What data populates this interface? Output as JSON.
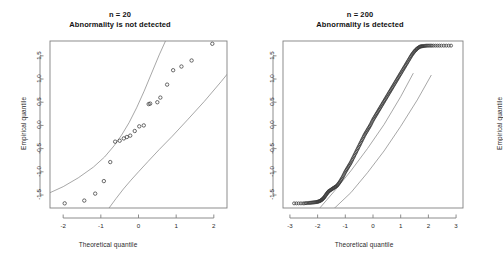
{
  "figure": {
    "background_color": "#ffffff",
    "axis_color": "#808080",
    "band_color": "#8a8a8a",
    "point_color": "#3a3a3a",
    "width": 480,
    "height": 256
  },
  "chart_data": [
    {
      "type": "scatter",
      "panel": "left",
      "title": "n = 20",
      "subtitle": "Abnormality is not detected",
      "xlabel": "Theoretical quantile",
      "ylabel": "Empirical quantile",
      "xlim": [
        -2.35,
        2.35
      ],
      "ylim": [
        -1.78,
        1.82
      ],
      "xticks": [
        -2,
        -1,
        0,
        1,
        2
      ],
      "xtick_labels": [
        "-2",
        "-1",
        "0",
        "1",
        "2"
      ],
      "yticks": [
        -1.5,
        -1.0,
        -0.5,
        0.0,
        0.5,
        1.0,
        1.5
      ],
      "ytick_labels": [
        "-1.5",
        "-1.0",
        "-0.5",
        "0.0",
        "0.5",
        "1.0",
        "1.5"
      ],
      "grid": false,
      "legend": "none",
      "points_label": "sample quantiles (n = 20)",
      "n": 20,
      "x": [
        -1.96,
        -1.44,
        -1.15,
        -0.92,
        -0.75,
        -0.62,
        -0.5,
        -0.39,
        -0.31,
        -0.22,
        -0.1,
        0.02,
        0.14,
        0.27,
        0.31,
        0.5,
        0.58,
        0.76,
        0.92,
        1.14,
        1.41,
        1.96
      ],
      "y": [
        -1.68,
        -1.62,
        -1.47,
        -1.2,
        -0.79,
        -0.35,
        -0.33,
        -0.28,
        -0.25,
        -0.22,
        -0.12,
        -0.02,
        0.0,
        0.46,
        0.47,
        0.5,
        0.6,
        0.88,
        1.19,
        1.27,
        1.4,
        1.76
      ],
      "band_upper_label": "upper confidence band",
      "band_lower_label": "lower confidence band",
      "band_upper_x": [
        -2.35,
        -2.0,
        -1.6,
        -1.2,
        -0.9,
        -0.65,
        -0.45,
        -0.25,
        -0.05,
        0.15,
        0.35,
        0.55,
        0.75
      ],
      "band_upper_y": [
        -1.45,
        -1.32,
        -1.13,
        -0.9,
        -0.68,
        -0.44,
        -0.21,
        0.06,
        0.38,
        0.74,
        1.13,
        1.52,
        1.88
      ],
      "band_lower_x": [
        -0.8,
        -0.6,
        -0.4,
        -0.2,
        0.0,
        0.25,
        0.55,
        0.9,
        1.3,
        1.75,
        2.2,
        2.35
      ],
      "band_lower_y": [
        -1.8,
        -1.58,
        -1.37,
        -1.18,
        -1.0,
        -0.78,
        -0.52,
        -0.23,
        0.12,
        0.52,
        0.95,
        1.1
      ]
    },
    {
      "type": "scatter",
      "panel": "right",
      "title": "n = 200",
      "subtitle": "Abnormality is detected",
      "xlabel": "Theoretical quantile",
      "ylabel": "Empirical quantile",
      "xlim": [
        -3.25,
        3.25
      ],
      "ylim": [
        -1.78,
        1.82
      ],
      "xticks": [
        -3,
        -2,
        -1,
        0,
        1,
        2,
        3
      ],
      "xtick_labels": [
        "-3",
        "-2",
        "-1",
        "0",
        "1",
        "2",
        "3"
      ],
      "yticks": [
        -1.5,
        -1.0,
        -0.5,
        0.0,
        0.5,
        1.0,
        1.5
      ],
      "ytick_labels": [
        "-1.5",
        "-1.0",
        "-0.5",
        "0.0",
        "0.5",
        "1.0",
        "1.5"
      ],
      "grid": false,
      "legend": "none",
      "points_label": "sample quantiles (n = 200)",
      "n": 200,
      "curve_x": [
        -2.85,
        -2.5,
        -2.3,
        -2.15,
        -2.02,
        -1.92,
        -1.84,
        -1.76,
        -1.68,
        -1.6,
        -1.5,
        -1.4,
        -1.3,
        -1.2,
        -1.1,
        -1.0,
        -0.9,
        -0.8,
        -0.7,
        -0.6,
        -0.5,
        -0.4,
        -0.3,
        -0.2,
        -0.1,
        0.0,
        0.1,
        0.2,
        0.3,
        0.4,
        0.5,
        0.6,
        0.7,
        0.8,
        0.9,
        1.0,
        1.1,
        1.2,
        1.3,
        1.4,
        1.5,
        1.6,
        1.7,
        1.8,
        1.95,
        2.15,
        2.45,
        2.82
      ],
      "curve_y": [
        -1.68,
        -1.68,
        -1.67,
        -1.66,
        -1.65,
        -1.63,
        -1.6,
        -1.55,
        -1.48,
        -1.42,
        -1.38,
        -1.34,
        -1.3,
        -1.22,
        -1.12,
        -1.0,
        -0.9,
        -0.8,
        -0.68,
        -0.56,
        -0.44,
        -0.32,
        -0.2,
        -0.1,
        0.0,
        0.12,
        0.22,
        0.32,
        0.42,
        0.52,
        0.62,
        0.72,
        0.82,
        0.92,
        1.02,
        1.12,
        1.22,
        1.32,
        1.42,
        1.52,
        1.6,
        1.66,
        1.7,
        1.71,
        1.72,
        1.72,
        1.72,
        1.72
      ],
      "band_upper_label": "upper confidence band",
      "band_lower_label": "lower confidence band",
      "band_upper_x": [
        -1.95,
        -1.4,
        -0.8,
        -0.2,
        0.4,
        1.0,
        1.45
      ],
      "band_upper_y": [
        -1.8,
        -1.42,
        -0.98,
        -0.5,
        0.02,
        0.62,
        1.12
      ],
      "band_lower_x": [
        -1.42,
        -0.8,
        -0.2,
        0.4,
        1.0,
        1.6,
        2.1
      ],
      "band_lower_y": [
        -1.8,
        -1.45,
        -1.02,
        -0.55,
        -0.02,
        0.55,
        1.08
      ]
    }
  ]
}
